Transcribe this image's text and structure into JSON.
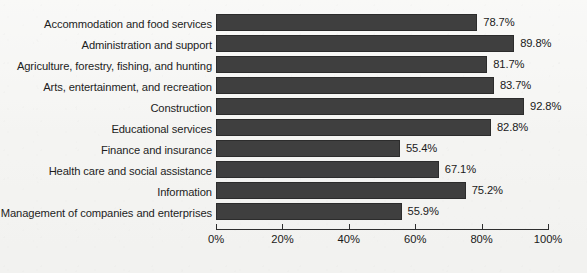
{
  "chart_data": {
    "type": "bar",
    "orientation": "horizontal",
    "title": "",
    "subtitle": "",
    "xlabel": "",
    "ylabel": "",
    "xlim": [
      0,
      100
    ],
    "grid": false,
    "legend": false,
    "legend_position": "none",
    "value_label_suffix": "%",
    "categories": [
      "Accommodation and food services",
      "Administration and support",
      "Agriculture, forestry, fishing, and hunting",
      "Arts, entertainment, and recreation",
      "Construction",
      "Educational services",
      "Finance and insurance",
      "Health care and social assistance",
      "Information",
      "Management of companies and enterprises"
    ],
    "values": [
      78.7,
      89.8,
      81.7,
      83.7,
      92.8,
      82.8,
      55.4,
      67.1,
      75.2,
      55.9
    ],
    "value_labels": [
      "78.7%",
      "89.8%",
      "81.7%",
      "83.7%",
      "92.8%",
      "82.8%",
      "55.4%",
      "67.1%",
      "75.2%",
      "55.9%"
    ],
    "xticks": [
      0,
      20,
      40,
      60,
      80,
      100
    ],
    "xtick_labels": [
      "0%",
      "20%",
      "40%",
      "60%",
      "80%",
      "100%"
    ],
    "colors": {
      "bar_fill": "#3f3f3f",
      "bar_edge": "#2c2c2c",
      "axis": "#2e2e2e",
      "text": "#1a1a1a",
      "background": "#f6f6f4"
    }
  }
}
